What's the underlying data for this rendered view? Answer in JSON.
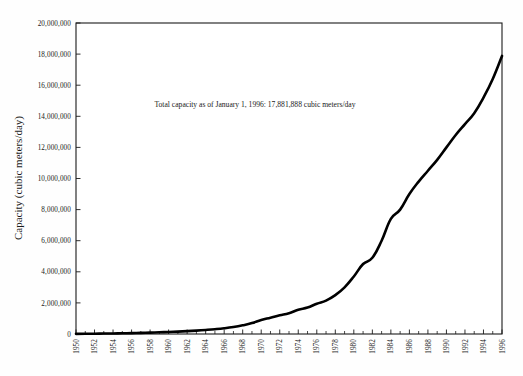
{
  "chart_data": {
    "type": "line",
    "title": "",
    "subtitle": "",
    "xlabel": "",
    "ylabel": "Capacity (cubic meters/day)",
    "xlim": [
      1950,
      1996
    ],
    "ylim": [
      0,
      20000000
    ],
    "grid": false,
    "legend": "none",
    "annotations": [
      {
        "text": "Total capacity as of January 1, 1996: 17,881,888 cubic meters/day",
        "x": 1972,
        "y": 15000000
      }
    ],
    "y_ticks": [
      0,
      2000000,
      4000000,
      6000000,
      8000000,
      10000000,
      12000000,
      14000000,
      16000000,
      18000000,
      20000000
    ],
    "y_tick_labels": [
      "0",
      "2,000,000",
      "4,000,000",
      "6,000,000",
      "8,000,000",
      "10,000,000",
      "12,000,000",
      "14,000,000",
      "16,000,000",
      "18,000,000",
      "20,000,000"
    ],
    "x_ticks": [
      1950,
      1951,
      1952,
      1953,
      1954,
      1955,
      1956,
      1957,
      1958,
      1959,
      1960,
      1961,
      1962,
      1963,
      1964,
      1965,
      1966,
      1967,
      1968,
      1969,
      1970,
      1971,
      1972,
      1973,
      1974,
      1975,
      1976,
      1977,
      1978,
      1979,
      1980,
      1981,
      1982,
      1983,
      1984,
      1985,
      1986,
      1987,
      1988,
      1989,
      1990,
      1991,
      1992,
      1993,
      1994,
      1995,
      1996
    ],
    "x_tick_labels": [
      "1950",
      "1952",
      "1954",
      "1956",
      "1958",
      "1960",
      "1962",
      "1964",
      "1966",
      "1968",
      "1970",
      "1972",
      "1974",
      "1976",
      "1978",
      "1980",
      "1982",
      "1984",
      "1986",
      "1988",
      "1990",
      "1992",
      "1994",
      "1996"
    ],
    "x_label_interval": 2,
    "series": [
      {
        "name": "Total capacity",
        "color": "#000000",
        "x": [
          1950,
          1951,
          1952,
          1953,
          1954,
          1955,
          1956,
          1957,
          1958,
          1959,
          1960,
          1961,
          1962,
          1963,
          1964,
          1965,
          1966,
          1967,
          1968,
          1969,
          1970,
          1971,
          1972,
          1973,
          1974,
          1975,
          1976,
          1977,
          1978,
          1979,
          1980,
          1981,
          1982,
          1983,
          1984,
          1985,
          1986,
          1987,
          1988,
          1989,
          1990,
          1991,
          1992,
          1993,
          1994,
          1995,
          1996
        ],
        "values": [
          10000,
          14000,
          20000,
          28000,
          36000,
          46000,
          58000,
          72000,
          88000,
          108000,
          130000,
          155000,
          185000,
          220000,
          262000,
          310000,
          370000,
          450000,
          560000,
          700000,
          900000,
          1050000,
          1200000,
          1340000,
          1560000,
          1700000,
          1950000,
          2150000,
          2500000,
          3000000,
          3700000,
          4500000,
          4900000,
          6000000,
          7400000,
          8000000,
          9000000,
          9800000,
          10500000,
          11200000,
          12000000,
          12800000,
          13500000,
          14200000,
          15200000,
          16400000,
          17881888
        ]
      }
    ],
    "final_value": 17881888,
    "final_value_formatted": "17,881,888",
    "units": "cubic meters/day"
  }
}
